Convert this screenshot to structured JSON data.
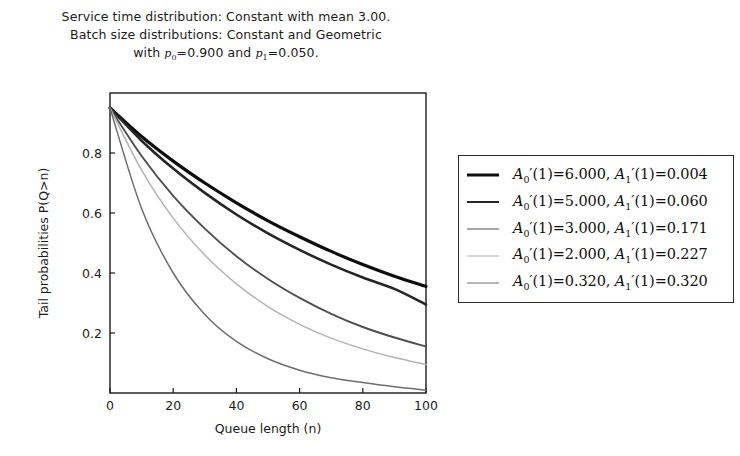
{
  "title": {
    "line1": "Service time distribution: Constant with mean 3.00.",
    "line2": "Batch size distributions: Constant and Geometric",
    "line3_prefix": "with ",
    "line3_p0_var": "p",
    "line3_p0_sub": "0",
    "line3_p0_val": "=0.900 and ",
    "line3_p1_var": "p",
    "line3_p1_sub": "1",
    "line3_p1_val": "=0.050."
  },
  "axes": {
    "xlabel": "Queue length (n)",
    "ylabel": "Tail probabilities P(Q>n)",
    "xticks": [
      "0",
      "20",
      "40",
      "60",
      "80",
      "100"
    ],
    "yticks": [
      "0.2",
      "0.4",
      "0.6",
      "0.8"
    ]
  },
  "legend": {
    "entries": [
      {
        "a0_label": "A",
        "a0_sub": "0",
        "a0_value": "(1)=6.000, ",
        "a1_label": "A",
        "a1_sub": "1",
        "a1_value": "(1)=0.004",
        "color": "#0d0d0d",
        "width": 3.2
      },
      {
        "a0_label": "A",
        "a0_sub": "0",
        "a0_value": "(1)=5.000, ",
        "a1_label": "A",
        "a1_sub": "1",
        "a1_value": "(1)=0.060",
        "color": "#262626",
        "width": 2.6
      },
      {
        "a0_label": "A",
        "a0_sub": "0",
        "a0_value": "(1)=3.000, ",
        "a1_label": "A",
        "a1_sub": "1",
        "a1_value": "(1)=0.171",
        "color": "#4f4f4f",
        "width": 1.9
      },
      {
        "a0_label": "A",
        "a0_sub": "0",
        "a0_value": "(1)=2.000, ",
        "a1_label": "A",
        "a1_sub": "1",
        "a1_value": "(1)=0.227",
        "color": "#b3b3b3",
        "width": 1.5
      },
      {
        "a0_label": "A",
        "a0_sub": "0",
        "a0_value": "(1)=0.320, ",
        "a1_label": "A",
        "a1_sub": "1",
        "a1_value": "(1)=0.320",
        "color": "#6e6e6e",
        "width": 1.5
      }
    ]
  },
  "chart_data": {
    "type": "line",
    "title": "Service time distribution: Constant with mean 3.00. Batch size distributions: Constant and Geometric with p0=0.900 and p1=0.050.",
    "xlabel": "Queue length (n)",
    "ylabel": "Tail probabilities P(Q>n)",
    "xlim": [
      0,
      100
    ],
    "ylim": [
      0,
      1.0
    ],
    "xticks": [
      0,
      20,
      40,
      60,
      80,
      100
    ],
    "yticks": [
      0.2,
      0.4,
      0.6,
      0.8
    ],
    "grid": false,
    "legend_position": "right-outside",
    "x": [
      0,
      10,
      20,
      30,
      40,
      50,
      60,
      70,
      80,
      90,
      100
    ],
    "series": [
      {
        "name": "A0'(1)=6.000, A1'(1)=0.004",
        "color": "#0d0d0d",
        "linewidth": 3.2,
        "values": [
          0.95,
          0.855,
          0.773,
          0.7,
          0.634,
          0.574,
          0.521,
          0.472,
          0.428,
          0.389,
          0.355
        ]
      },
      {
        "name": "A0'(1)=5.000, A1'(1)=0.060",
        "color": "#262626",
        "linewidth": 2.6,
        "values": [
          0.95,
          0.841,
          0.748,
          0.667,
          0.595,
          0.532,
          0.477,
          0.428,
          0.385,
          0.347,
          0.295
        ]
      },
      {
        "name": "A0'(1)=3.000, A1'(1)=0.171",
        "color": "#4f4f4f",
        "linewidth": 1.9,
        "values": [
          0.95,
          0.79,
          0.657,
          0.548,
          0.456,
          0.38,
          0.317,
          0.264,
          0.22,
          0.185,
          0.155
        ]
      },
      {
        "name": "A0'(1)=2.000, A1'(1)=0.227",
        "color": "#b3b3b3",
        "linewidth": 1.5,
        "values": [
          0.95,
          0.743,
          0.583,
          0.46,
          0.364,
          0.288,
          0.229,
          0.183,
          0.147,
          0.118,
          0.095
        ]
      },
      {
        "name": "A0'(1)=0.320, A1'(1)=0.320",
        "color": "#6e6e6e",
        "linewidth": 1.5,
        "values": [
          0.95,
          0.615,
          0.4,
          0.262,
          0.172,
          0.114,
          0.076,
          0.051,
          0.035,
          0.021,
          0.01
        ]
      }
    ]
  }
}
